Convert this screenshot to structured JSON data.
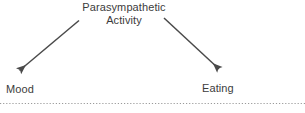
{
  "diagram": {
    "type": "node-arrow-diagram",
    "background_color": "#ffffff",
    "ink_color": "#3c3c3c",
    "nodes": [
      {
        "id": "source",
        "name": "parasympathetic-activity",
        "lines": [
          "Parasympathetic",
          "Activity"
        ],
        "position": "top-center"
      },
      {
        "id": "target-left",
        "name": "mood",
        "label": "Mood",
        "position": "bottom-left"
      },
      {
        "id": "target-right",
        "name": "eating",
        "label": "Eating",
        "position": "bottom-right"
      }
    ],
    "arrows": [
      {
        "id": "arrow-left",
        "from": "source",
        "to": "target-left",
        "direction": "down-left",
        "style": "solid-line-with-filled-arrowhead",
        "color": "#4a4a4a"
      },
      {
        "id": "arrow-right",
        "from": "source",
        "to": "target-right",
        "direction": "down-right",
        "style": "solid-line-with-filled-arrowhead",
        "color": "#4a4a4a"
      }
    ],
    "divider": {
      "name": "dotted-divider",
      "style": "dotted",
      "color": "#9a9a9a"
    }
  }
}
